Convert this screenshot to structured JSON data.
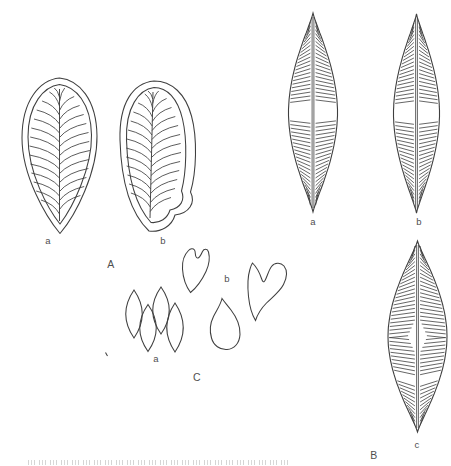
{
  "figure": {
    "background": "#ffffff",
    "ink": "#3f3f3f",
    "label_color": "#4f4f4f",
    "group_a": {
      "label": "A",
      "item_a": "a",
      "item_b": "b"
    },
    "group_b": {
      "label": "B",
      "item_a": "a",
      "item_b": "b",
      "item_c": "c"
    },
    "group_c": {
      "label": "C",
      "item_a": "a",
      "item_b": "b"
    }
  }
}
